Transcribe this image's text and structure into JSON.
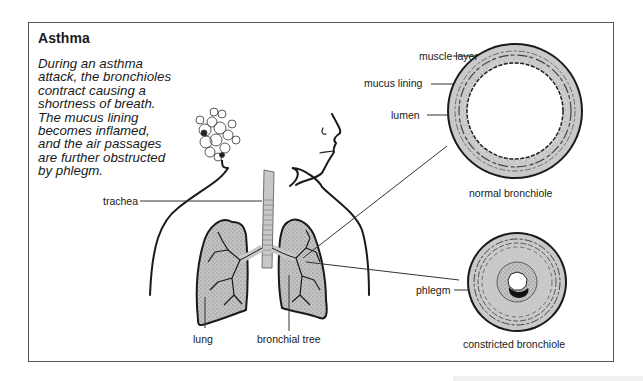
{
  "figure": {
    "title": "Asthma",
    "description": "During an asthma\nattack, the bronchioles\ncontract causing a\nshortness of breath.\nThe mucus lining\nbecomes inflamed,\nand the air passages\nare further obstructed\nby phlegm."
  },
  "labels": {
    "muscle_layer": "muscle layer",
    "mucus_lining": "mucus lining",
    "lumen": "lumen",
    "normal_bronchiole": "normal bronchiole",
    "trachea": "trachea",
    "phlegm": "phlegm",
    "constricted_bronchiole": "constricted bronchiole",
    "lung": "lung",
    "bronchial_tree": "bronchial tree"
  },
  "colors": {
    "outline": "#1a1a1a",
    "wall_fill": "#c8c8c8",
    "lung_fill": "#b9b9b9",
    "frame": "#555555",
    "phlegm": "#111111"
  }
}
